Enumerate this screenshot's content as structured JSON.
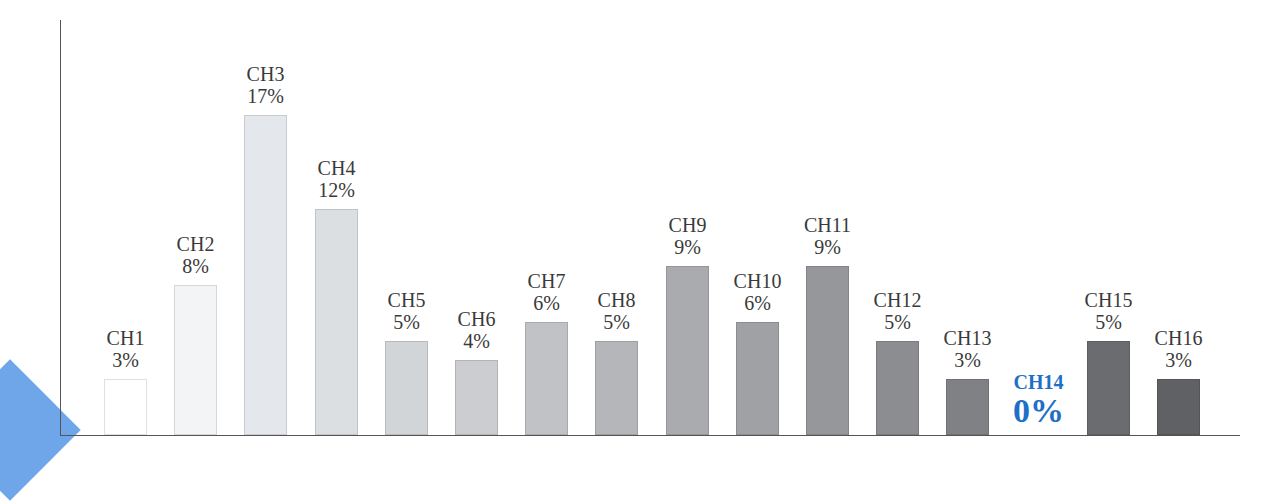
{
  "chart_data": {
    "type": "bar",
    "title": "",
    "xlabel": "",
    "ylabel": "",
    "ylim": [
      0,
      18
    ],
    "grid": false,
    "legend": null,
    "categories": [
      "CH1",
      "CH2",
      "CH3",
      "CH4",
      "CH5",
      "CH6",
      "CH7",
      "CH8",
      "CH9",
      "CH10",
      "CH11",
      "CH12",
      "CH13",
      "CH14",
      "CH15",
      "CH16"
    ],
    "values": [
      3,
      8,
      17,
      12,
      5,
      4,
      6,
      5,
      9,
      6,
      9,
      5,
      3,
      0,
      5,
      3
    ],
    "value_labels": [
      "3%",
      "8%",
      "17%",
      "12%",
      "5%",
      "4%",
      "6%",
      "5%",
      "9%",
      "6%",
      "9%",
      "5%",
      "3%",
      "0%",
      "5%",
      "3%"
    ],
    "bar_colors": [
      "#ffffff",
      "#f2f4f6",
      "#e4e8ec",
      "#dcdfe2",
      "#d2d5d8",
      "#cbcdd0",
      "#c0c2c5",
      "#b4b6b9",
      "#a9abae",
      "#9fa1a4",
      "#95979a",
      "#8b8d90",
      "#7f8184",
      "#ffffff",
      "#6a6c6f",
      "#5f6164"
    ],
    "highlight": {
      "category": "CH14",
      "color": "#1f6fc7"
    },
    "annotations": [
      "CH14 0% highlighted in blue"
    ]
  },
  "decor": {
    "corner_shape_color": "#6fa6ea"
  }
}
